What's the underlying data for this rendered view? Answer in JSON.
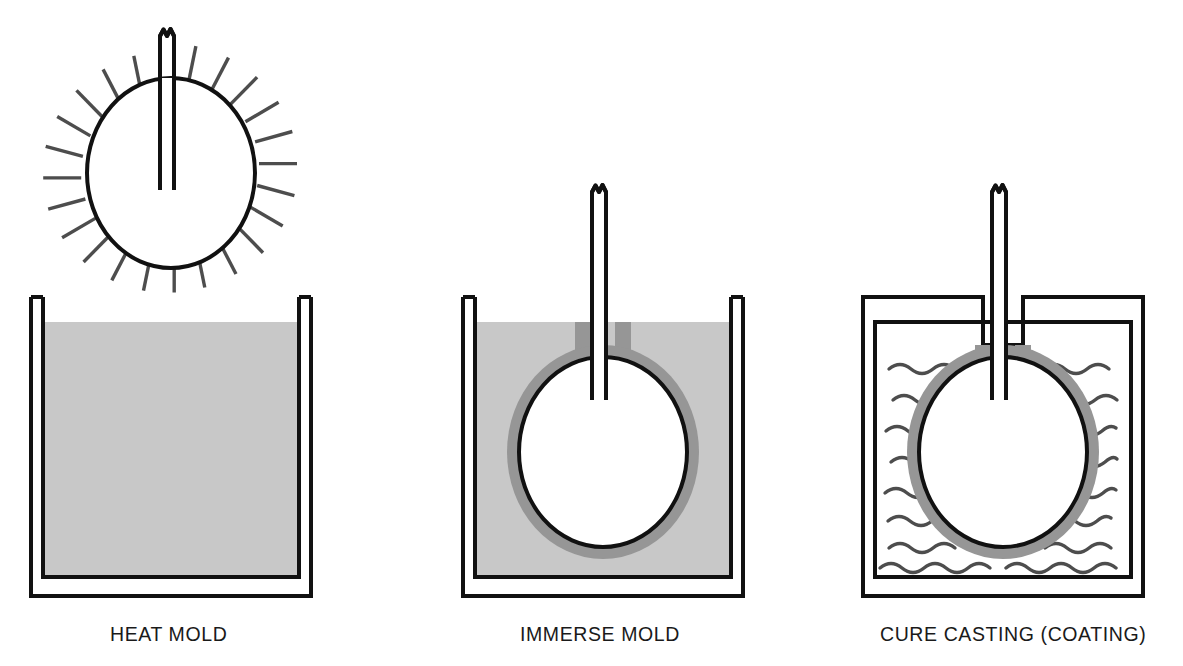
{
  "figure": {
    "type": "process-diagram",
    "title": "",
    "background_color": "#ffffff",
    "panel_count": 3
  },
  "palette": {
    "outline": "#111111",
    "liquid_fill": "#c8c8c8",
    "coating_fill": "#969696",
    "heat_ray": "#4d4d4d",
    "wave_line": "#4d4d4d",
    "label_text": "#1a1a1a",
    "vessel_interior": "#ffffff"
  },
  "panels": [
    {
      "id": "heat-mold",
      "label": "HEAT MOLD",
      "label_x": 110,
      "label_y": 641,
      "stage": 1,
      "vessel": {
        "kind": "open-tank",
        "filled": true,
        "fill": "liquid"
      },
      "mold": {
        "present": true,
        "position": "above-tank",
        "coated": false,
        "cx": 171,
        "cy": 173,
        "rx": 84,
        "ry": 95
      },
      "heat_rays": {
        "present": true,
        "count": 24
      },
      "waves": {
        "present": false
      }
    },
    {
      "id": "immerse-mold",
      "label": "IMMERSE MOLD",
      "label_x": 520,
      "label_y": 641,
      "stage": 2,
      "vessel": {
        "kind": "open-tank",
        "filled": true,
        "fill": "liquid"
      },
      "mold": {
        "present": true,
        "position": "submerged",
        "coated": true,
        "cx": 603,
        "cy": 452,
        "rx": 84,
        "ry": 95
      },
      "heat_rays": {
        "present": false
      },
      "waves": {
        "present": false
      }
    },
    {
      "id": "cure-casting",
      "label": "CURE CASTING (COATING)",
      "label_x": 880,
      "label_y": 641,
      "stage": 3,
      "vessel": {
        "kind": "closed-oven",
        "filled": false,
        "fill": "none"
      },
      "mold": {
        "present": true,
        "position": "inside-oven",
        "coated": true,
        "cx": 1003,
        "cy": 452,
        "rx": 84,
        "ry": 95
      },
      "heat_rays": {
        "present": false
      },
      "waves": {
        "present": true,
        "rows": 11
      }
    }
  ],
  "legend_note": ""
}
